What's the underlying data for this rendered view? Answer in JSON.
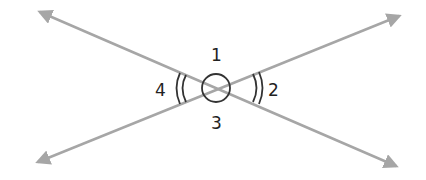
{
  "diagram": {
    "line_color": "#a6a6a6",
    "mark_color": "#333333",
    "angles": [
      {
        "id": "1",
        "label": "1",
        "position": "top",
        "mark": "single arc (circle)"
      },
      {
        "id": "2",
        "label": "2",
        "position": "right",
        "mark": "double arc"
      },
      {
        "id": "3",
        "label": "3",
        "position": "bottom",
        "mark": "single arc (circle)"
      },
      {
        "id": "4",
        "label": "4",
        "position": "left",
        "mark": "double arc"
      }
    ]
  }
}
